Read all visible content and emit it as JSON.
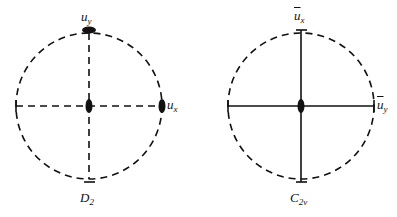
{
  "diagrams": [
    {
      "id": "left",
      "group_label": "D",
      "group_sub": "2",
      "center": [
        89,
        106
      ],
      "radius": 73,
      "circle_style": "dashed",
      "axes_style": "dashed",
      "labels": {
        "top": {
          "base": "u",
          "sub": "y",
          "overbar": false
        },
        "right": {
          "base": "u",
          "sub": "x",
          "overbar": false
        }
      },
      "rotation_markers": [
        "center",
        "top",
        "right"
      ]
    },
    {
      "id": "right",
      "group_label": "C",
      "group_sub": "2v",
      "center": [
        301,
        106
      ],
      "radius": 73,
      "circle_style": "dashed",
      "axes_style": "solid",
      "labels": {
        "top": {
          "base": "u",
          "sub": "x",
          "overbar": true
        },
        "right": {
          "base": "u",
          "sub": "y",
          "overbar": true
        }
      },
      "rotation_markers": [
        "center"
      ]
    }
  ],
  "colors": {
    "stroke": "#111111",
    "background": "#ffffff"
  }
}
